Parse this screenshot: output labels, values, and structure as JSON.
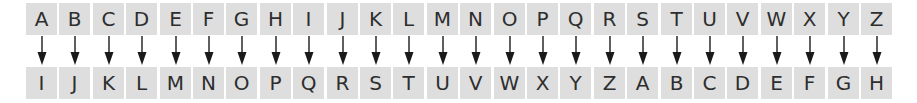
{
  "diagram": {
    "type": "caesar-cipher-shift",
    "shift": 8,
    "plain_row": [
      "A",
      "B",
      "C",
      "D",
      "E",
      "F",
      "G",
      "H",
      "I",
      "J",
      "K",
      "L",
      "M",
      "N",
      "O",
      "P",
      "Q",
      "R",
      "S",
      "T",
      "U",
      "V",
      "W",
      "X",
      "Y",
      "Z"
    ],
    "cipher_row": [
      "I",
      "J",
      "K",
      "L",
      "M",
      "N",
      "O",
      "P",
      "Q",
      "R",
      "S",
      "T",
      "U",
      "V",
      "W",
      "X",
      "Y",
      "Z",
      "A",
      "B",
      "C",
      "D",
      "E",
      "F",
      "G",
      "H"
    ],
    "colors": {
      "cell_background": "#dedede",
      "text": "#2e2e2e",
      "arrow": "#1a1a1a",
      "page_background": "#ffffff"
    }
  }
}
